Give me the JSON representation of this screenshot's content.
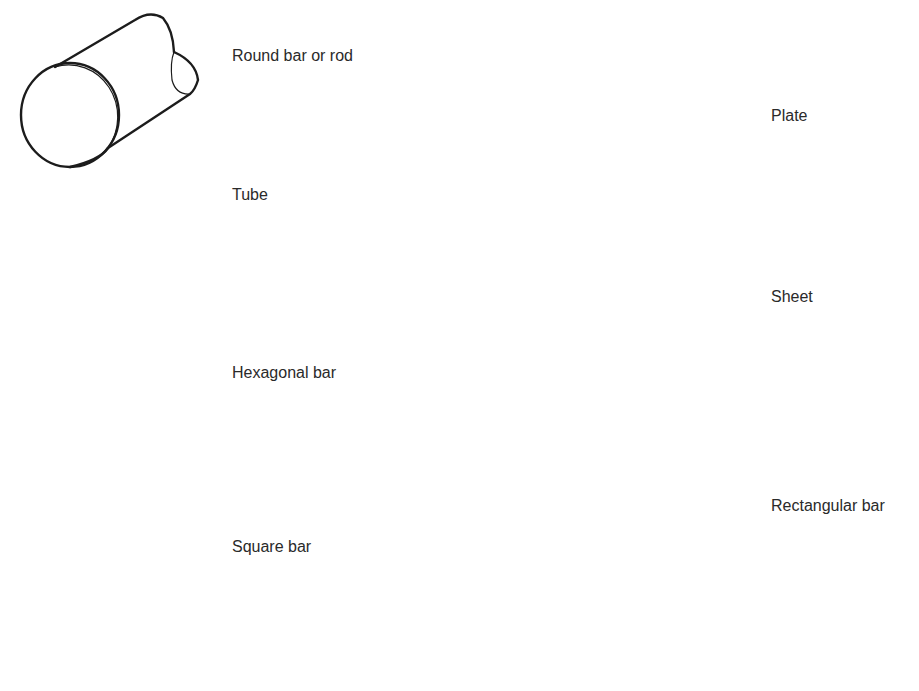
{
  "diagram": {
    "type": "stock-shapes-illustration",
    "shapes": [
      {
        "id": "round-bar",
        "label": "Round bar or rod"
      },
      {
        "id": "tube",
        "label": "Tube"
      },
      {
        "id": "hexagonal-bar",
        "label": "Hexagonal bar"
      },
      {
        "id": "square-bar",
        "label": "Square bar"
      },
      {
        "id": "plate",
        "label": "Plate"
      },
      {
        "id": "sheet",
        "label": "Sheet"
      },
      {
        "id": "rectangular-bar",
        "label": "Rectangular bar"
      }
    ],
    "colors": {
      "line": "#1c1c1c",
      "text": "#2a2a2a",
      "background": "#ffffff"
    }
  }
}
